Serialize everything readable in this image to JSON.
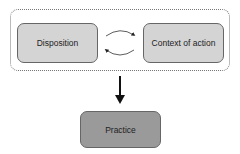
{
  "diagram": {
    "nodes": {
      "disposition": "Disposition",
      "context": "Context of action",
      "practice": "Practice"
    },
    "edges": [
      {
        "from": "disposition",
        "to": "context",
        "type": "cyclic"
      },
      {
        "from": "group",
        "to": "practice",
        "type": "arrow"
      }
    ]
  }
}
